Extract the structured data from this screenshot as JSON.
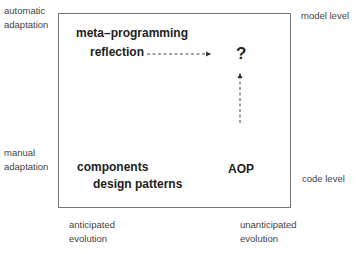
{
  "axes": {
    "top_left": [
      "automatic",
      "adaptation"
    ],
    "bottom_left": [
      "manual",
      "adaptation"
    ],
    "top_right": "model level",
    "bottom_right": "code level",
    "bottom_x_left": [
      "anticipated",
      "evolution"
    ],
    "bottom_x_right": [
      "unanticipated",
      "evolution"
    ]
  },
  "quadrants": {
    "top_left_items": [
      "meta–programming",
      "reflection"
    ],
    "top_right_item": "?",
    "bottom_left_items": [
      "components",
      "design patterns"
    ],
    "bottom_right_item": "AOP"
  },
  "arrows": [
    {
      "from": "reflection",
      "to": "?",
      "style": "dashed"
    },
    {
      "from": "AOP",
      "to": "?",
      "style": "dashed"
    }
  ]
}
